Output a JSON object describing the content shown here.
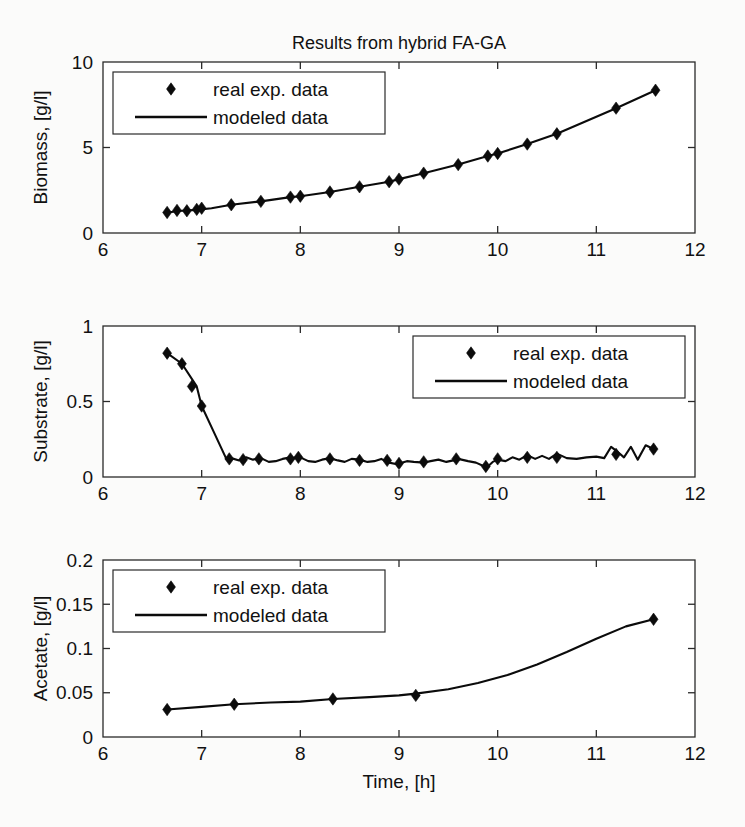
{
  "figure": {
    "title": "Results from hybrid FA-GA",
    "xlabel": "Time, [h]",
    "legend": {
      "marker_label": "real exp. data",
      "line_label": "modeled data"
    },
    "colors": {
      "line": "#0b0b0b",
      "marker": "#0b0b0b",
      "axis": "#2a2a2a",
      "background": "#fbfbfa"
    }
  },
  "chart_data": [
    {
      "type": "line",
      "id": "biomass",
      "title": "Results from hybrid FA-GA",
      "xlabel": "",
      "ylabel": "Biomass, [g/l]",
      "xlim": [
        6,
        12
      ],
      "ylim": [
        0,
        10
      ],
      "xticks": [
        6,
        7,
        8,
        9,
        10,
        11,
        12
      ],
      "xticklabels": [
        "6",
        "7",
        "8",
        "9",
        "10",
        "11",
        "12"
      ],
      "yticks": [
        0,
        5,
        10
      ],
      "yticklabels": [
        "0",
        "5",
        "10"
      ],
      "grid": false,
      "legend_position": "upper-left",
      "series": [
        {
          "name": "modeled data",
          "style": "line",
          "x": [
            6.65,
            6.8,
            6.95,
            7.1,
            7.3,
            7.6,
            7.9,
            8.0,
            8.3,
            8.6,
            8.9,
            9.0,
            9.25,
            9.6,
            9.9,
            10.0,
            10.3,
            10.6,
            11.2,
            11.6
          ],
          "y": [
            1.2,
            1.3,
            1.35,
            1.45,
            1.65,
            1.85,
            2.1,
            2.15,
            2.4,
            2.7,
            3.0,
            3.15,
            3.5,
            4.0,
            4.5,
            4.65,
            5.2,
            5.8,
            7.3,
            8.35
          ]
        },
        {
          "name": "real exp. data",
          "style": "marker",
          "x": [
            6.65,
            6.75,
            6.85,
            6.95,
            7.0,
            7.3,
            7.6,
            7.9,
            8.0,
            8.3,
            8.6,
            8.9,
            9.0,
            9.25,
            9.6,
            9.9,
            10.0,
            10.3,
            10.6,
            11.2,
            11.6
          ],
          "y": [
            1.2,
            1.32,
            1.3,
            1.38,
            1.45,
            1.65,
            1.85,
            2.1,
            2.15,
            2.4,
            2.7,
            3.0,
            3.15,
            3.5,
            4.0,
            4.5,
            4.65,
            5.2,
            5.8,
            7.3,
            8.35
          ]
        }
      ]
    },
    {
      "type": "line",
      "id": "substrate",
      "title": "",
      "xlabel": "",
      "ylabel": "Substrate, [g/l]",
      "xlim": [
        6,
        12
      ],
      "ylim": [
        0,
        1
      ],
      "xticks": [
        6,
        7,
        8,
        9,
        10,
        11,
        12
      ],
      "xticklabels": [
        "6",
        "7",
        "8",
        "9",
        "10",
        "11",
        "12"
      ],
      "yticks": [
        0,
        0.5,
        1
      ],
      "yticklabels": [
        "0",
        "0.5",
        "1"
      ],
      "grid": false,
      "legend_position": "upper-right",
      "series": [
        {
          "name": "modeled data",
          "style": "line-noisy",
          "x": [
            6.65,
            6.8,
            6.95,
            7.0,
            7.1,
            7.25,
            7.3,
            7.38,
            7.45,
            7.52,
            7.6,
            7.68,
            7.75,
            7.82,
            7.9,
            7.95,
            8.0,
            8.08,
            8.15,
            8.22,
            8.3,
            8.38,
            8.45,
            8.52,
            8.6,
            8.68,
            8.75,
            8.82,
            8.9,
            8.98,
            9.0,
            9.08,
            9.15,
            9.25,
            9.32,
            9.4,
            9.48,
            9.55,
            9.6,
            9.7,
            9.78,
            9.85,
            9.9,
            9.95,
            10.0,
            10.08,
            10.15,
            10.22,
            10.3,
            10.38,
            10.45,
            10.52,
            10.6,
            10.7,
            10.8,
            10.9,
            11.0,
            11.08,
            11.15,
            11.2,
            11.28,
            11.35,
            11.42,
            11.5,
            11.58
          ],
          "y": [
            0.82,
            0.75,
            0.6,
            0.47,
            0.33,
            0.12,
            0.125,
            0.11,
            0.13,
            0.115,
            0.125,
            0.1,
            0.105,
            0.12,
            0.13,
            0.125,
            0.13,
            0.105,
            0.1,
            0.115,
            0.125,
            0.11,
            0.1,
            0.12,
            0.115,
            0.1,
            0.105,
            0.12,
            0.095,
            0.085,
            0.09,
            0.105,
            0.1,
            0.095,
            0.105,
            0.115,
            0.1,
            0.11,
            0.12,
            0.105,
            0.095,
            0.075,
            0.07,
            0.1,
            0.115,
            0.105,
            0.13,
            0.115,
            0.145,
            0.12,
            0.14,
            0.12,
            0.155,
            0.125,
            0.12,
            0.13,
            0.135,
            0.125,
            0.2,
            0.175,
            0.13,
            0.2,
            0.115,
            0.21,
            0.185
          ]
        },
        {
          "name": "real exp. data",
          "style": "marker",
          "x": [
            6.65,
            6.8,
            6.9,
            7.0,
            7.28,
            7.42,
            7.58,
            7.9,
            7.98,
            8.3,
            8.6,
            8.88,
            9.0,
            9.25,
            9.58,
            9.88,
            10.0,
            10.3,
            10.6,
            11.2,
            11.58
          ],
          "y": [
            0.82,
            0.75,
            0.6,
            0.47,
            0.12,
            0.115,
            0.12,
            0.12,
            0.13,
            0.12,
            0.11,
            0.11,
            0.09,
            0.1,
            0.12,
            0.07,
            0.12,
            0.13,
            0.13,
            0.15,
            0.185
          ]
        }
      ]
    },
    {
      "type": "line",
      "id": "acetate",
      "title": "",
      "xlabel": "Time, [h]",
      "ylabel": "Acetate, [g/l]",
      "xlim": [
        6,
        12
      ],
      "ylim": [
        0,
        0.2
      ],
      "xticks": [
        6,
        7,
        8,
        9,
        10,
        11,
        12
      ],
      "xticklabels": [
        "6",
        "7",
        "8",
        "9",
        "10",
        "11",
        "12"
      ],
      "yticks": [
        0,
        0.05,
        0.1,
        0.15,
        0.2
      ],
      "yticklabels": [
        "0",
        "0.05",
        "0.1",
        "0.15",
        "0.2"
      ],
      "grid": false,
      "legend_position": "upper-left",
      "series": [
        {
          "name": "modeled data",
          "style": "line",
          "x": [
            6.65,
            7.0,
            7.33,
            7.7,
            8.0,
            8.33,
            8.7,
            9.0,
            9.17,
            9.5,
            9.8,
            10.1,
            10.4,
            10.7,
            11.0,
            11.3,
            11.58
          ],
          "y": [
            0.031,
            0.034,
            0.037,
            0.039,
            0.04,
            0.043,
            0.045,
            0.047,
            0.049,
            0.054,
            0.061,
            0.07,
            0.082,
            0.096,
            0.111,
            0.125,
            0.133
          ]
        },
        {
          "name": "real exp. data",
          "style": "marker",
          "x": [
            6.65,
            7.33,
            8.33,
            9.17,
            11.58
          ],
          "y": [
            0.031,
            0.037,
            0.043,
            0.047,
            0.133
          ]
        }
      ]
    }
  ]
}
